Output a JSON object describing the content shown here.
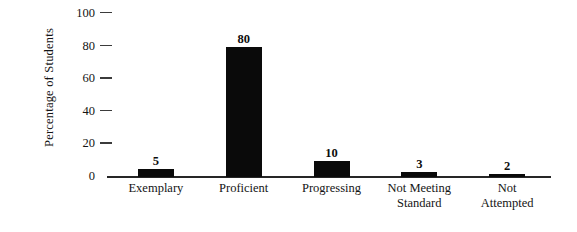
{
  "chart_data": {
    "type": "bar",
    "title": "",
    "xlabel": "",
    "ylabel": "Percentage of Students",
    "categories": [
      "Exemplary",
      "Proficient",
      "Progressing",
      "Not Meeting Standard",
      "Not Attempted"
    ],
    "values": [
      5,
      80,
      10,
      3,
      2
    ],
    "value_labels": [
      "5",
      "80",
      "10",
      "3",
      "2"
    ],
    "ylim": [
      0,
      100
    ],
    "yticks": [
      0,
      20,
      40,
      60,
      80,
      100
    ],
    "ytick_labels": [
      "0",
      "20",
      "40",
      "60",
      "80",
      "100"
    ],
    "grid": false,
    "legend": "none",
    "bar_color": "#0a0a0a",
    "axis_color": "#262626",
    "background_color": "#ffffff"
  },
  "axis": {
    "y_title": "Percentage of Students"
  },
  "category_lines": [
    [
      "Exemplary"
    ],
    [
      "Proficient"
    ],
    [
      "Progressing"
    ],
    [
      "Not Meeting",
      "Standard"
    ],
    [
      "Not",
      "Attempted"
    ]
  ]
}
